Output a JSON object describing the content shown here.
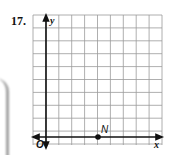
{
  "problem": {
    "number": "17."
  },
  "graph": {
    "x_axis_label": "x",
    "y_axis_label": "y",
    "origin_label": "O",
    "grid": {
      "columns": 10,
      "rows": 10,
      "x_min": -1,
      "x_max": 9,
      "y_min": -1,
      "y_max": 9
    },
    "points": [
      {
        "label": "N",
        "x": 4,
        "y": 0
      }
    ]
  },
  "colors": {
    "grid": "#9a9a9a",
    "axes": "#111111",
    "point": "#111111"
  }
}
